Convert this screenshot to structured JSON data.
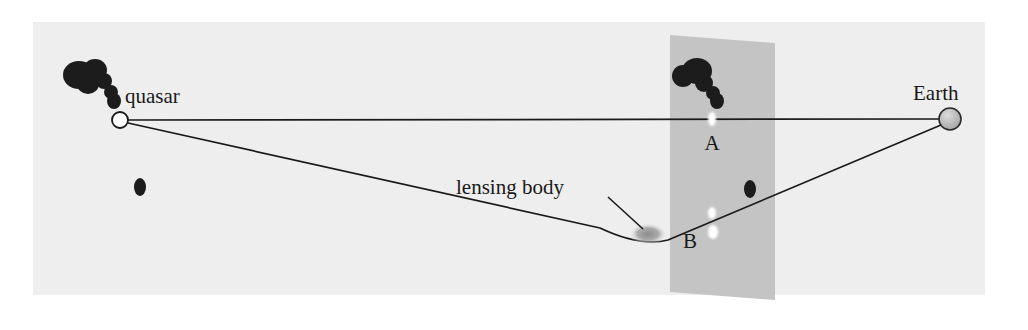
{
  "figure": {
    "panel": {
      "background_color": "#eeeeee",
      "x": 33,
      "y": 22,
      "width": 952,
      "height": 273
    },
    "page_background_color": "#ffffff",
    "ray_color": "#1a1a1a",
    "blob_color": "#1c1c1c",
    "highlight_color": "#ffffff",
    "lens_color": "#9a9a9a",
    "plane_color": "#c4c4c4"
  },
  "labels": {
    "quasar": "quasar",
    "earth": "Earth",
    "lensing_body": "lensing body",
    "image_a": "A",
    "image_b": "B"
  },
  "objects": {
    "quasar_marker": {
      "name": "quasar",
      "shape": "open-circle",
      "cx": 120,
      "cy": 120,
      "r": 8,
      "fill": "#ffffff",
      "stroke": "#1a1a1a"
    },
    "earth_marker": {
      "name": "Earth",
      "shape": "shaded-sphere",
      "cx": 950,
      "cy": 119,
      "r": 11,
      "fill": "#b9b9b9",
      "stroke": "#2a2a2a"
    },
    "lensing_body": {
      "name": "lensing body",
      "shape": "blurred-ellipse",
      "cx": 648,
      "cy": 234,
      "rx": 16,
      "ry": 9,
      "fill": "#9a9a9a"
    },
    "lens_plane": {
      "name": "image plane",
      "shape": "parallelogram",
      "fill": "#c4c4c4",
      "points": "670,35 775,43 775,300 670,292"
    }
  },
  "rays": {
    "straight_ray": {
      "name": "undeflected-ray-A",
      "description": "Direct ray from quasar through image A to Earth",
      "path": "M128,120 L941,119"
    },
    "bent_ray": {
      "name": "deflected-ray-B",
      "description": "Ray from quasar bent around the lensing body to Earth, appearing as image B"
    }
  },
  "image_a": {
    "label": "A",
    "label_x": 719,
    "label_y": 148,
    "highlight": {
      "cx": 712,
      "cy": 119,
      "rx": 4,
      "ry": 7
    },
    "blobs": [
      {
        "cx": 697,
        "cy": 71,
        "rx": 15,
        "ry": 13
      },
      {
        "cx": 683,
        "cy": 76,
        "rx": 11,
        "ry": 11
      },
      {
        "cx": 704,
        "cy": 83,
        "rx": 9,
        "ry": 9
      },
      {
        "cx": 713,
        "cy": 93,
        "rx": 7,
        "ry": 7
      },
      {
        "cx": 717,
        "cy": 101,
        "rx": 7,
        "ry": 8
      }
    ]
  },
  "image_b": {
    "label": "B",
    "label_x": 687,
    "label_y": 246,
    "highlight_main": {
      "cx": 713,
      "cy": 232,
      "rx": 5,
      "ry": 7
    },
    "highlight_small": {
      "cx": 712,
      "cy": 213,
      "rx": 4,
      "ry": 6
    },
    "blob": {
      "cx": 750,
      "cy": 189,
      "rx": 6,
      "ry": 9
    }
  },
  "quasar_cluster": {
    "blobs": [
      {
        "cx": 79,
        "cy": 75,
        "rx": 16,
        "ry": 14
      },
      {
        "cx": 95,
        "cy": 70,
        "rx": 12,
        "ry": 11
      },
      {
        "cx": 88,
        "cy": 84,
        "rx": 11,
        "ry": 10
      },
      {
        "cx": 104,
        "cy": 81,
        "rx": 8,
        "ry": 8
      },
      {
        "cx": 111,
        "cy": 92,
        "rx": 7,
        "ry": 7
      },
      {
        "cx": 114,
        "cy": 101,
        "rx": 7,
        "ry": 8
      }
    ],
    "stray_blob": {
      "cx": 140,
      "cy": 187,
      "rx": 6,
      "ry": 9
    }
  },
  "leader_line": {
    "name": "lensing-body-pointer",
    "from_x": 608,
    "from_y": 197,
    "to_x": 641,
    "to_y": 228
  },
  "margin_text_lines": [
    "l",
    "t",
    "i",
    "f",
    "o"
  ]
}
